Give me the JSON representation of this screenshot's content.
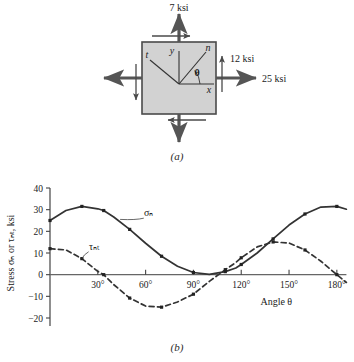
{
  "figure": {
    "caption_a": "(a)",
    "caption_b": "(b)"
  },
  "stress_element": {
    "title_top_label": "7 ksi",
    "right_normal_label": "25 ksi",
    "shear_label": "12 ksi",
    "axis_labels": {
      "x": "x",
      "y": "y",
      "n": "n",
      "t": "t",
      "theta": "θ"
    },
    "colors": {
      "fill": "#d2d2d2",
      "border": "#4a4a4a",
      "arrow": "#555555"
    },
    "values": {
      "sigma_x_ksi": 25,
      "sigma_y_ksi": 7,
      "tau_xy_ksi": 12
    }
  },
  "chart_data": {
    "type": "line",
    "title": "",
    "xlabel": "Angle θ",
    "ylabel": "Stress σₙ or τₙₜ, ksi",
    "xlim": [
      0,
      187
    ],
    "ylim": [
      -20,
      40
    ],
    "xticks": [
      30,
      60,
      90,
      120,
      150,
      180
    ],
    "xtick_labels": [
      "30°",
      "60°",
      "90°",
      "120°",
      "150°",
      "180°"
    ],
    "yticks": [
      -20,
      -10,
      0,
      10,
      20,
      30,
      40
    ],
    "ytick_labels": [
      "−20",
      "−10",
      "0",
      "10",
      "20",
      "30",
      "40"
    ],
    "grid": false,
    "legend_position": "inline",
    "series": [
      {
        "name": "σₙ",
        "label": "σₙ",
        "style": "solid",
        "color": "#333333",
        "markers": true,
        "x": [
          0,
          10,
          20,
          30,
          33.7,
          40,
          50,
          60,
          70,
          80,
          90,
          100,
          110,
          116.6,
          120,
          130,
          140,
          150,
          160,
          170,
          180,
          186
        ],
        "y": [
          25.0,
          29.6,
          31.5,
          30.4,
          29.6,
          26.6,
          20.9,
          14.5,
          8.5,
          3.9,
          1.0,
          0.1,
          1.4,
          3.1,
          4.7,
          10.0,
          16.5,
          22.9,
          28.0,
          31.2,
          31.5,
          30.2
        ]
      },
      {
        "name": "τₙₜ",
        "label": "τₙₜ",
        "style": "dashed",
        "color": "#333333",
        "markers": true,
        "x": [
          0,
          10,
          20,
          30,
          33.7,
          40,
          50,
          60,
          70,
          80,
          90,
          100,
          110,
          116.6,
          120,
          130,
          140,
          150,
          160,
          170,
          180,
          186
        ],
        "y": [
          12.0,
          11.4,
          7.4,
          1.5,
          0.0,
          -4.6,
          -10.8,
          -14.5,
          -15.0,
          -12.6,
          -9.0,
          -3.1,
          2.3,
          5.6,
          7.8,
          12.8,
          15.1,
          14.6,
          11.4,
          6.2,
          0.0,
          -3.6
        ]
      }
    ],
    "annotations": [
      {
        "text": "σₙ",
        "x": 62,
        "y": 27
      },
      {
        "text": "τₙₜ",
        "x": 28,
        "y": 11.5
      }
    ]
  }
}
